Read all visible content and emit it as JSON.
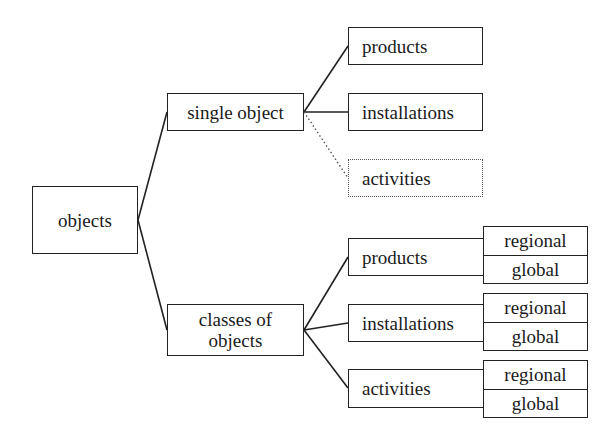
{
  "diagram": {
    "root": {
      "label": "objects"
    },
    "branches": [
      {
        "label": "single object",
        "children": [
          {
            "label": "products",
            "style": "solid"
          },
          {
            "label": "installations",
            "style": "solid"
          },
          {
            "label": "activities",
            "style": "dotted"
          }
        ]
      },
      {
        "label": "classes of objects",
        "label_lines": [
          "classes of",
          "objects"
        ],
        "children": [
          {
            "label": "products",
            "scopes": [
              "regional",
              "global"
            ]
          },
          {
            "label": "installations",
            "scopes": [
              "regional",
              "global"
            ]
          },
          {
            "label": "activities",
            "scopes": [
              "regional",
              "global"
            ]
          }
        ]
      }
    ],
    "colors": {
      "line": "#222222",
      "dotted_line": "#555555",
      "background": "#ffffff"
    }
  }
}
